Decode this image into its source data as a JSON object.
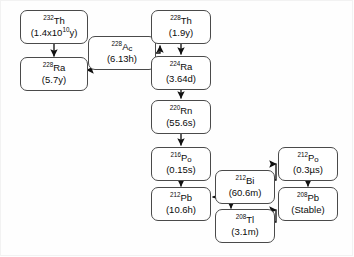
{
  "diagram": {
    "type": "decay-chain-flowchart",
    "background_color": "#fefefe",
    "box_fill": "#ffffff",
    "box_border_color": "#4a4a4a",
    "arrow_color": "#111111"
  },
  "nodes": [
    {
      "id": "th232",
      "mass": "232",
      "element": "Th",
      "element_sub": "",
      "half_life": "(1.4x10",
      "half_life_exp": "10",
      "half_life_tail": "y)",
      "label": "232Th (1.4x10^10 y)"
    },
    {
      "id": "ra228",
      "mass": "228",
      "element": "Ra",
      "element_sub": "",
      "half_life": "(5.7y)",
      "label": "228Ra (5.7y)"
    },
    {
      "id": "ac228",
      "mass": "228",
      "element": "A",
      "element_sub": "c",
      "half_life": "(6.13h)",
      "label": "228Ac (6.13h)"
    },
    {
      "id": "th228",
      "mass": "228",
      "element": "Th",
      "element_sub": "",
      "half_life": "(1.9y)",
      "label": "228Th (1.9y)"
    },
    {
      "id": "ra224",
      "mass": "224",
      "element": "Ra",
      "element_sub": "",
      "half_life": "(3.64d)",
      "label": "224Ra (3.64d)"
    },
    {
      "id": "rn220",
      "mass": "220",
      "element": "Rn",
      "element_sub": "",
      "half_life": "(55.6s)",
      "label": "220Rn (55.6s)"
    },
    {
      "id": "po216",
      "mass": "216",
      "element": "P",
      "element_sub": "o",
      "half_life": "(0.15s)",
      "label": "216Po (0.15s)"
    },
    {
      "id": "pb212",
      "mass": "212",
      "element": "Pb",
      "element_sub": "",
      "half_life": "(10.6h)",
      "label": "212Pb (10.6h)"
    },
    {
      "id": "bi212",
      "mass": "212",
      "element": "Bi",
      "element_sub": "",
      "half_life": "(60.6m)",
      "label": "212Bi (60.6m)"
    },
    {
      "id": "tl208",
      "mass": "208",
      "element": "Tl",
      "element_sub": "",
      "half_life": "(3.1m)",
      "label": "208Tl (3.1m)"
    },
    {
      "id": "po212",
      "mass": "212",
      "element": "P",
      "element_sub": "o",
      "half_life": "(0.3µs)",
      "label": "212Po (0.3us)"
    },
    {
      "id": "pb208",
      "mass": "208",
      "element": "Pb",
      "element_sub": "",
      "half_life": "(Stable)",
      "label": "208Pb (Stable)"
    }
  ],
  "edges": [
    {
      "from": "th232",
      "to": "ra228",
      "kind": "vertical-down"
    },
    {
      "from": "ra228",
      "to": "ac228",
      "kind": "horizontal-right-into-left"
    },
    {
      "from": "ac228",
      "to": "th228",
      "kind": "right-then-up"
    },
    {
      "from": "th228",
      "to": "ra224",
      "kind": "vertical-down"
    },
    {
      "from": "ra224",
      "to": "rn220",
      "kind": "vertical-down"
    },
    {
      "from": "rn220",
      "to": "po216",
      "kind": "vertical-down"
    },
    {
      "from": "po216",
      "to": "pb212",
      "kind": "vertical-down"
    },
    {
      "from": "bi212",
      "to": "pb212",
      "kind": "horizontal-left"
    },
    {
      "from": "bi212",
      "to": "po212",
      "kind": "right-then-up"
    },
    {
      "from": "bi212",
      "to": "tl208",
      "kind": "vertical-down"
    },
    {
      "from": "po212",
      "to": "pb208",
      "kind": "vertical-down"
    },
    {
      "from": "tl208",
      "to": "pb208",
      "kind": "right-then-up"
    }
  ]
}
